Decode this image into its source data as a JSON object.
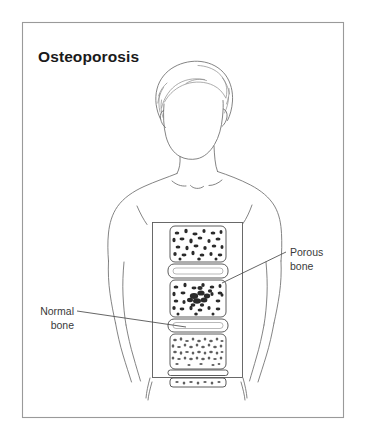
{
  "figure": {
    "title": "Osteoporosis",
    "domain_kind": "medical-illustration",
    "background_color": "#ffffff",
    "frame": {
      "stroke_color": "#9a9a9a",
      "x": 22,
      "y": 22,
      "width": 322,
      "height": 396
    },
    "line_art_color": "#6e6e6e",
    "ink_color": "#2a2a2a"
  },
  "subject": {
    "name": "human-torso-figure",
    "description": "front-facing head, neck, shoulders, arms and torso outline"
  },
  "inset": {
    "name": "spine-cutaway-panel",
    "x": 152,
    "y": 222,
    "width": 91,
    "height": 156,
    "stroke_color": "#5a5a5a",
    "segments": [
      {
        "kind": "vertebra",
        "label": "porous-vertebra-upper",
        "bone_state": "porous"
      },
      {
        "kind": "disc",
        "label": "intervertebral-disc-1"
      },
      {
        "kind": "vertebra",
        "label": "porous-vertebra-middle",
        "bone_state": "porous"
      },
      {
        "kind": "disc",
        "label": "intervertebral-disc-2"
      },
      {
        "kind": "vertebra",
        "label": "normal-vertebra",
        "bone_state": "normal"
      },
      {
        "kind": "disc",
        "label": "intervertebral-disc-3"
      },
      {
        "kind": "vertebra",
        "label": "vertebra-partial-lower",
        "bone_state": "normal"
      }
    ]
  },
  "callouts": [
    {
      "id": "porous-bone",
      "line1": "Porous",
      "line2": "bone",
      "align": "left",
      "text_x": 290,
      "text_y1": 256,
      "text_y2": 270,
      "leader": {
        "x1": 286,
        "y1": 252,
        "x2": 222,
        "y2": 283
      }
    },
    {
      "id": "normal-bone",
      "line1": "Normal",
      "line2": "bone",
      "align": "right",
      "text_x": 74,
      "text_y1": 315,
      "text_y2": 329,
      "leader": {
        "x1": 77,
        "y1": 311,
        "x2": 186,
        "y2": 327
      }
    }
  ]
}
